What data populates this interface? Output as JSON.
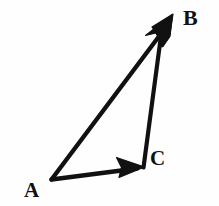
{
  "figure": {
    "kind": "vector-triangle-diagram",
    "background_color": "#fefefe",
    "stroke_color": "#111111",
    "stroke_width_px": 4,
    "width_px": 219,
    "height_px": 206
  },
  "vertices": [
    {
      "name": "A",
      "label": "A",
      "x": 51,
      "y": 179,
      "label_x": 31,
      "label_y": 190
    },
    {
      "name": "B",
      "label": "B",
      "x": 172,
      "y": 16,
      "label_x": 191,
      "label_y": 18
    },
    {
      "name": "C",
      "label": "C",
      "x": 143,
      "y": 167,
      "label_x": 157,
      "label_y": 159
    }
  ],
  "vectors": [
    {
      "name": "AB",
      "label": "",
      "from": "A",
      "to": "B",
      "arrowhead": "at-tip",
      "x1": 51,
      "y1": 179,
      "x2": 166,
      "y2": 26
    },
    {
      "name": "AC",
      "label": "",
      "from": "A",
      "to": "C",
      "arrowhead": "at-tip",
      "x1": 51,
      "y1": 179,
      "x2": 136,
      "y2": 168
    },
    {
      "name": "CB",
      "label": "",
      "from": "C",
      "to": "B",
      "arrowhead": "at-tip",
      "x1": 143,
      "y1": 167,
      "x2": 161,
      "y2": 30
    }
  ]
}
